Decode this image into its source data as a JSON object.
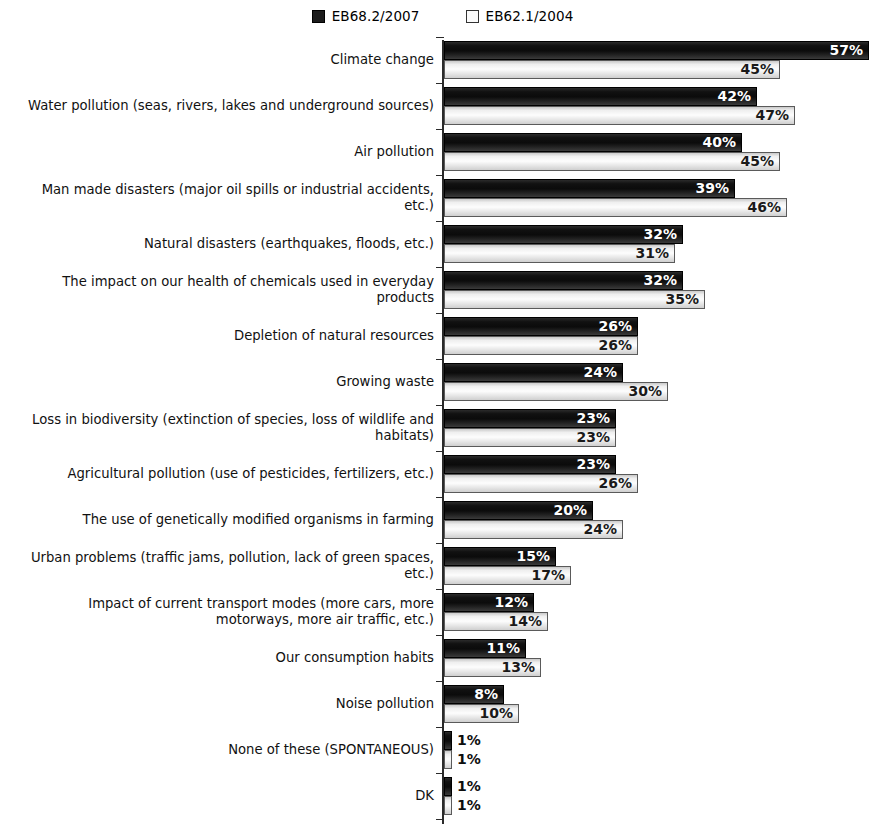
{
  "legend": {
    "entries": [
      {
        "label": "EB68.2/2007",
        "swatch": "filled-square-icon",
        "color": "#1c1c1c"
      },
      {
        "label": "EB62.1/2004",
        "swatch": "outlined-square-icon",
        "color": "#fbfbfb"
      }
    ]
  },
  "chart_data": {
    "type": "bar",
    "orientation": "horizontal",
    "title": "",
    "xlabel": "",
    "ylabel": "",
    "xlim": [
      0,
      60
    ],
    "grid": false,
    "legend_position": "top-center",
    "value_suffix": "%",
    "categories": [
      "Climate change",
      "Water pollution (seas, rivers, lakes and underground sources)",
      "Air pollution",
      "Man made disasters (major oil spills or industrial accidents, etc.)",
      "Natural disasters (earthquakes, floods, etc.)",
      "The impact on our health of chemicals used in everyday products",
      "Depletion of natural resources",
      "Growing waste",
      "Loss in biodiversity (extinction of species, loss of wildlife and habitats)",
      "Agricultural pollution (use of pesticides, fertilizers, etc.)",
      "The use of genetically modified organisms in farming",
      "Urban problems (traffic jams, pollution, lack of green spaces, etc.)",
      "Impact of current transport modes (more cars, more motorways, more air traffic, etc.)",
      "Our consumption habits",
      "Noise pollution",
      "None of these (SPONTANEOUS)",
      "DK"
    ],
    "series": [
      {
        "name": "EB68.2/2007",
        "values": [
          57,
          42,
          40,
          39,
          32,
          32,
          26,
          24,
          23,
          23,
          20,
          15,
          12,
          11,
          8,
          1,
          1
        ],
        "labels": [
          "57%",
          "42%",
          "40%",
          "39%",
          "32%",
          "32%",
          "26%",
          "24%",
          "23%",
          "23%",
          "20%",
          "15%",
          "12%",
          "11%",
          "8%",
          "1%",
          "1%"
        ]
      },
      {
        "name": "EB62.1/2004",
        "values": [
          45,
          47,
          45,
          46,
          31,
          35,
          26,
          30,
          23,
          26,
          24,
          17,
          14,
          13,
          10,
          1,
          1
        ],
        "labels": [
          "45%",
          "47%",
          "45%",
          "46%",
          "31%",
          "35%",
          "26%",
          "30%",
          "23%",
          "26%",
          "24%",
          "17%",
          "14%",
          "13%",
          "10%",
          "1%",
          "1%"
        ]
      }
    ]
  }
}
